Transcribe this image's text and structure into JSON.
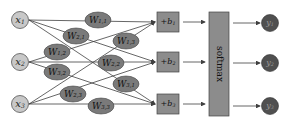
{
  "diagram": {
    "inputs": [
      {
        "id": "x1",
        "label": "x",
        "sub": "1",
        "cx": 20,
        "cy": 20
      },
      {
        "id": "x2",
        "label": "x",
        "sub": "2",
        "cx": 20,
        "cy": 62
      },
      {
        "id": "x3",
        "label": "x",
        "sub": "3",
        "cx": 20,
        "cy": 104
      }
    ],
    "weights": [
      {
        "label": "W",
        "sub": "1,1",
        "cx": 98,
        "cy": 20
      },
      {
        "label": "W",
        "sub": "2,1",
        "cx": 76,
        "cy": 36
      },
      {
        "label": "W",
        "sub": "1,2",
        "cx": 57,
        "cy": 52
      },
      {
        "label": "W",
        "sub": "1,3",
        "cx": 126,
        "cy": 41
      },
      {
        "label": "W",
        "sub": "2,2",
        "cx": 111,
        "cy": 63
      },
      {
        "label": "W",
        "sub": "3,2",
        "cx": 57,
        "cy": 72
      },
      {
        "label": "W",
        "sub": "2,3",
        "cx": 73,
        "cy": 94
      },
      {
        "label": "W",
        "sub": "3,1",
        "cx": 126,
        "cy": 84
      },
      {
        "label": "W",
        "sub": "3,3",
        "cx": 101,
        "cy": 106
      }
    ],
    "biases": [
      {
        "label": "+b",
        "sub": "1",
        "x": 157,
        "y": 12,
        "w": 22,
        "h": 20
      },
      {
        "label": "+b",
        "sub": "2",
        "x": 157,
        "y": 52,
        "w": 22,
        "h": 20
      },
      {
        "label": "+b",
        "sub": "3",
        "x": 157,
        "y": 94,
        "w": 22,
        "h": 20
      }
    ],
    "softmax": {
      "label": "softmax",
      "x": 209,
      "y": 12,
      "w": 20,
      "h": 104
    },
    "outputs": [
      {
        "id": "y1",
        "label": "y",
        "sub": "1",
        "cx": 270,
        "cy": 23
      },
      {
        "id": "y2",
        "label": "y",
        "sub": "2",
        "cx": 270,
        "cy": 63
      },
      {
        "id": "y3",
        "label": "y",
        "sub": "3",
        "cx": 270,
        "cy": 106
      }
    ],
    "colors": {
      "input_fill": "#c8c8c8",
      "weight_fill": "#7a7a7a",
      "bias_fill": "#8c8c8c",
      "softmax_fill": "#8c8c8c",
      "output_fill": "#505050",
      "line": "#404040"
    }
  }
}
